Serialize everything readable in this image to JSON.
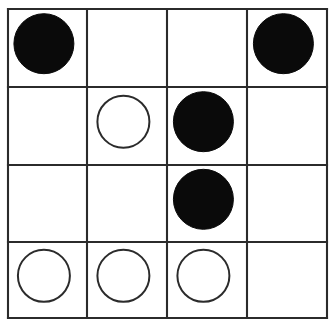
{
  "board": {
    "title": "Grid Board",
    "rows": 4,
    "columns": 4,
    "background_color": "#ffffff",
    "line_color": "#2b2b2b",
    "black_piece_color": "#0a0a0a",
    "white_piece_fill": "#ffffff",
    "white_piece_stroke": "#2b2b2b",
    "geometry": {
      "x_lines": [
        8,
        87,
        167,
        247,
        327
      ],
      "y_lines": [
        9,
        87,
        165,
        242,
        318
      ],
      "black_radius": 30,
      "white_radius": 26
    },
    "cells": [
      {
        "row": 0,
        "col": 0,
        "state": "black",
        "label": "black-stone"
      },
      {
        "row": 0,
        "col": 1,
        "state": "empty",
        "label": "empty-cell"
      },
      {
        "row": 0,
        "col": 2,
        "state": "empty",
        "label": "empty-cell"
      },
      {
        "row": 0,
        "col": 3,
        "state": "black",
        "label": "black-stone"
      },
      {
        "row": 1,
        "col": 0,
        "state": "empty",
        "label": "empty-cell"
      },
      {
        "row": 1,
        "col": 1,
        "state": "white",
        "label": "white-stone"
      },
      {
        "row": 1,
        "col": 2,
        "state": "black",
        "label": "black-stone"
      },
      {
        "row": 1,
        "col": 3,
        "state": "empty",
        "label": "empty-cell"
      },
      {
        "row": 2,
        "col": 0,
        "state": "empty",
        "label": "empty-cell"
      },
      {
        "row": 2,
        "col": 1,
        "state": "empty",
        "label": "empty-cell"
      },
      {
        "row": 2,
        "col": 2,
        "state": "black",
        "label": "black-stone"
      },
      {
        "row": 2,
        "col": 3,
        "state": "empty",
        "label": "empty-cell"
      },
      {
        "row": 3,
        "col": 0,
        "state": "white",
        "label": "white-stone"
      },
      {
        "row": 3,
        "col": 1,
        "state": "white",
        "label": "white-stone"
      },
      {
        "row": 3,
        "col": 2,
        "state": "white",
        "label": "white-stone"
      },
      {
        "row": 3,
        "col": 3,
        "state": "empty",
        "label": "empty-cell"
      }
    ],
    "counts": {
      "black": 4,
      "white": 4,
      "empty": 8
    }
  }
}
